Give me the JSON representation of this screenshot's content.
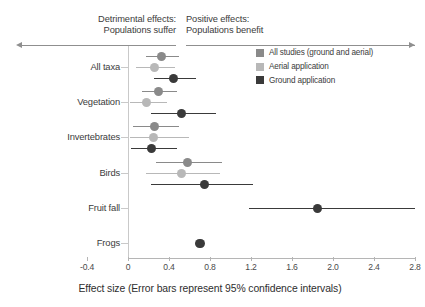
{
  "header": {
    "left_line1": "Detrimental effects:",
    "left_line2": "Populations suffer",
    "right_line1": "Positive effects:",
    "right_line2": "Populations benefit",
    "left_arrow_icon": "arrow-left-icon",
    "right_arrow_icon": "arrow-right-icon"
  },
  "legend": {
    "position": "top-right",
    "items": [
      {
        "label": "All studies (ground and aerial)",
        "color": "#8a8a8a"
      },
      {
        "label": "Aerial application",
        "color": "#b8b8b8"
      },
      {
        "label": "Ground application",
        "color": "#3a3a3a"
      }
    ]
  },
  "chart_data": {
    "type": "scatter",
    "subtype": "forest-plot",
    "title": "",
    "xlabel": "Effect size (Error bars represent 95% confidence intervals)",
    "ylabel": "",
    "xlim": [
      -0.4,
      2.8
    ],
    "xticks": [
      -0.4,
      0,
      0.4,
      0.8,
      1.2,
      1.6,
      2.0,
      2.4,
      2.8
    ],
    "xticklabels": [
      "-0.4",
      "0",
      "0.4",
      "0.8",
      "1.2",
      "1.6",
      "2.0",
      "2.4",
      "2.8"
    ],
    "grid": false,
    "reference_line": 0,
    "categories": [
      "All taxa",
      "Vegetation",
      "Invertebrates",
      "Birds",
      "Fruit fall",
      "Frogs"
    ],
    "series": [
      {
        "name": "All studies (ground and aerial)",
        "color": "#8a8a8a",
        "points": [
          {
            "category": "All taxa",
            "value": 0.33,
            "ci_low": 0.18,
            "ci_high": 0.5
          },
          {
            "category": "Vegetation",
            "value": 0.3,
            "ci_low": 0.14,
            "ci_high": 0.48
          },
          {
            "category": "Invertebrates",
            "value": 0.26,
            "ci_low": 0.05,
            "ci_high": 0.5
          },
          {
            "category": "Birds",
            "value": 0.58,
            "ci_low": 0.27,
            "ci_high": 0.92
          }
        ]
      },
      {
        "name": "Aerial application",
        "color": "#b8b8b8",
        "points": [
          {
            "category": "All taxa",
            "value": 0.26,
            "ci_low": 0.08,
            "ci_high": 0.46
          },
          {
            "category": "Vegetation",
            "value": 0.18,
            "ci_low": 0.02,
            "ci_high": 0.38
          },
          {
            "category": "Invertebrates",
            "value": 0.25,
            "ci_low": 0.02,
            "ci_high": 0.6
          },
          {
            "category": "Birds",
            "value": 0.52,
            "ci_low": 0.18,
            "ci_high": 0.9
          }
        ]
      },
      {
        "name": "Ground application",
        "color": "#3a3a3a",
        "points": [
          {
            "category": "All taxa",
            "value": 0.44,
            "ci_low": 0.25,
            "ci_high": 0.66
          },
          {
            "category": "Vegetation",
            "value": 0.52,
            "ci_low": 0.22,
            "ci_high": 0.86
          },
          {
            "category": "Invertebrates",
            "value": 0.23,
            "ci_low": 0.03,
            "ci_high": 0.48
          },
          {
            "category": "Birds",
            "value": 0.75,
            "ci_low": 0.22,
            "ci_high": 1.22
          },
          {
            "category": "Fruit fall",
            "value": 1.85,
            "ci_low": 1.18,
            "ci_high": 2.8
          },
          {
            "category": "Frogs",
            "value": 0.7,
            "ci_low": 0.7,
            "ci_high": 0.7
          }
        ]
      }
    ]
  }
}
